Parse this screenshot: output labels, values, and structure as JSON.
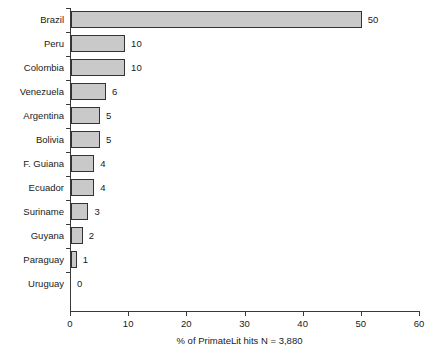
{
  "chart_data": {
    "type": "bar",
    "orientation": "horizontal",
    "title": "",
    "subtitle": "",
    "xlabel": "% of PrimateLit hits N = 3,880",
    "ylabel": "",
    "xlim": [
      0,
      60
    ],
    "xticks": [
      0,
      10,
      20,
      30,
      40,
      50,
      60
    ],
    "xtick_labels": [
      "0",
      "10",
      "20",
      "30",
      "40",
      "50",
      "60"
    ],
    "grid": false,
    "legend": false,
    "categories": [
      "Brazil",
      "Peru",
      "Colombia",
      "Venezuela",
      "Argentina",
      "Bolivia",
      "F. Guiana",
      "Ecuador",
      "Suriname",
      "Guyana",
      "Paraguay",
      "Uruguay"
    ],
    "values": [
      50,
      10,
      10,
      6,
      5,
      5,
      4,
      4,
      3,
      2,
      1,
      0
    ],
    "data_labels": [
      "50",
      "10",
      "10",
      "6",
      "5",
      "5",
      "4",
      "4",
      "3",
      "2",
      "1",
      "0"
    ],
    "bar_fill_color": "#c9c9c9",
    "bar_border_color": "#333333",
    "axis_color": "#3a3a3a",
    "text_color": "#1a1a1a",
    "background_color": "#ffffff"
  }
}
